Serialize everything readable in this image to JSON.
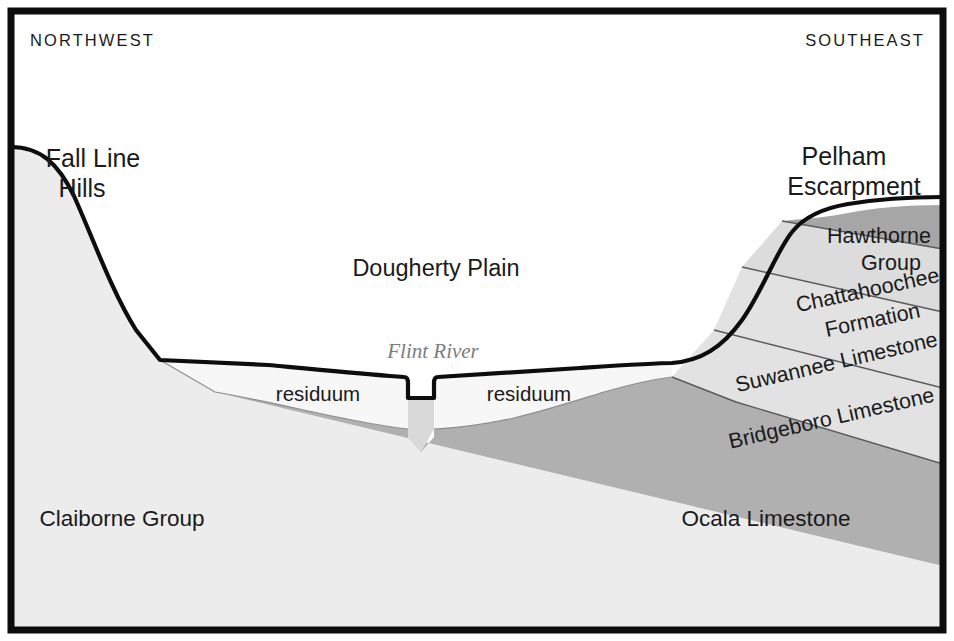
{
  "figure": {
    "kind": "geologic-cross-section",
    "orientation_labels": {
      "left": "NORTHWEST",
      "right": "SOUTHEAST"
    }
  },
  "physiographic_features": [
    {
      "id": "fall-line-hills",
      "line1": "Fall Line",
      "line2": "Hills"
    },
    {
      "id": "dougherty-plain",
      "label": "Dougherty Plain"
    },
    {
      "id": "pelham-escarpment",
      "line1": "Pelham",
      "line2": "Escarpment"
    }
  ],
  "hydrology": {
    "river_label": "Flint River"
  },
  "surficial_units": {
    "residuum_left_label": "residuum",
    "residuum_right_label": "residuum"
  },
  "stratigraphic_units": [
    {
      "id": "hawthorne-group",
      "line1": "Hawthorne",
      "line2": "Group",
      "color": "#a6a6a6"
    },
    {
      "id": "chattahoochee-formation",
      "line1": "Chattahoochee",
      "line2": "Formation",
      "color": "#dcdcdc"
    },
    {
      "id": "suwannee-limestone",
      "label": "Suwannee Limestone",
      "color": "#e2e2e2"
    },
    {
      "id": "bridgeboro-limestone",
      "label": "Bridgeboro Limestone",
      "color": "#e2e2e2"
    },
    {
      "id": "ocala-limestone",
      "label": "Ocala Limestone",
      "color": "#b0b0b0"
    },
    {
      "id": "claiborne-group",
      "label": "Claiborne Group",
      "color": "#ececec"
    }
  ],
  "colors": {
    "frame": "#0d0d0d",
    "surface_line": "#0d0d0d",
    "background": "#ffffff",
    "residuum": "#f7f7f7",
    "claiborne": "#ececec",
    "ocala": "#b0b0b0",
    "hawthorne": "#a6a6a6",
    "chattahoochee": "#dcdcdc",
    "suwannee": "#e2e2e2",
    "bridgeboro": "#e2e2e2",
    "river_water": "#d9d9d9",
    "river_text": "#7d7d7d"
  }
}
